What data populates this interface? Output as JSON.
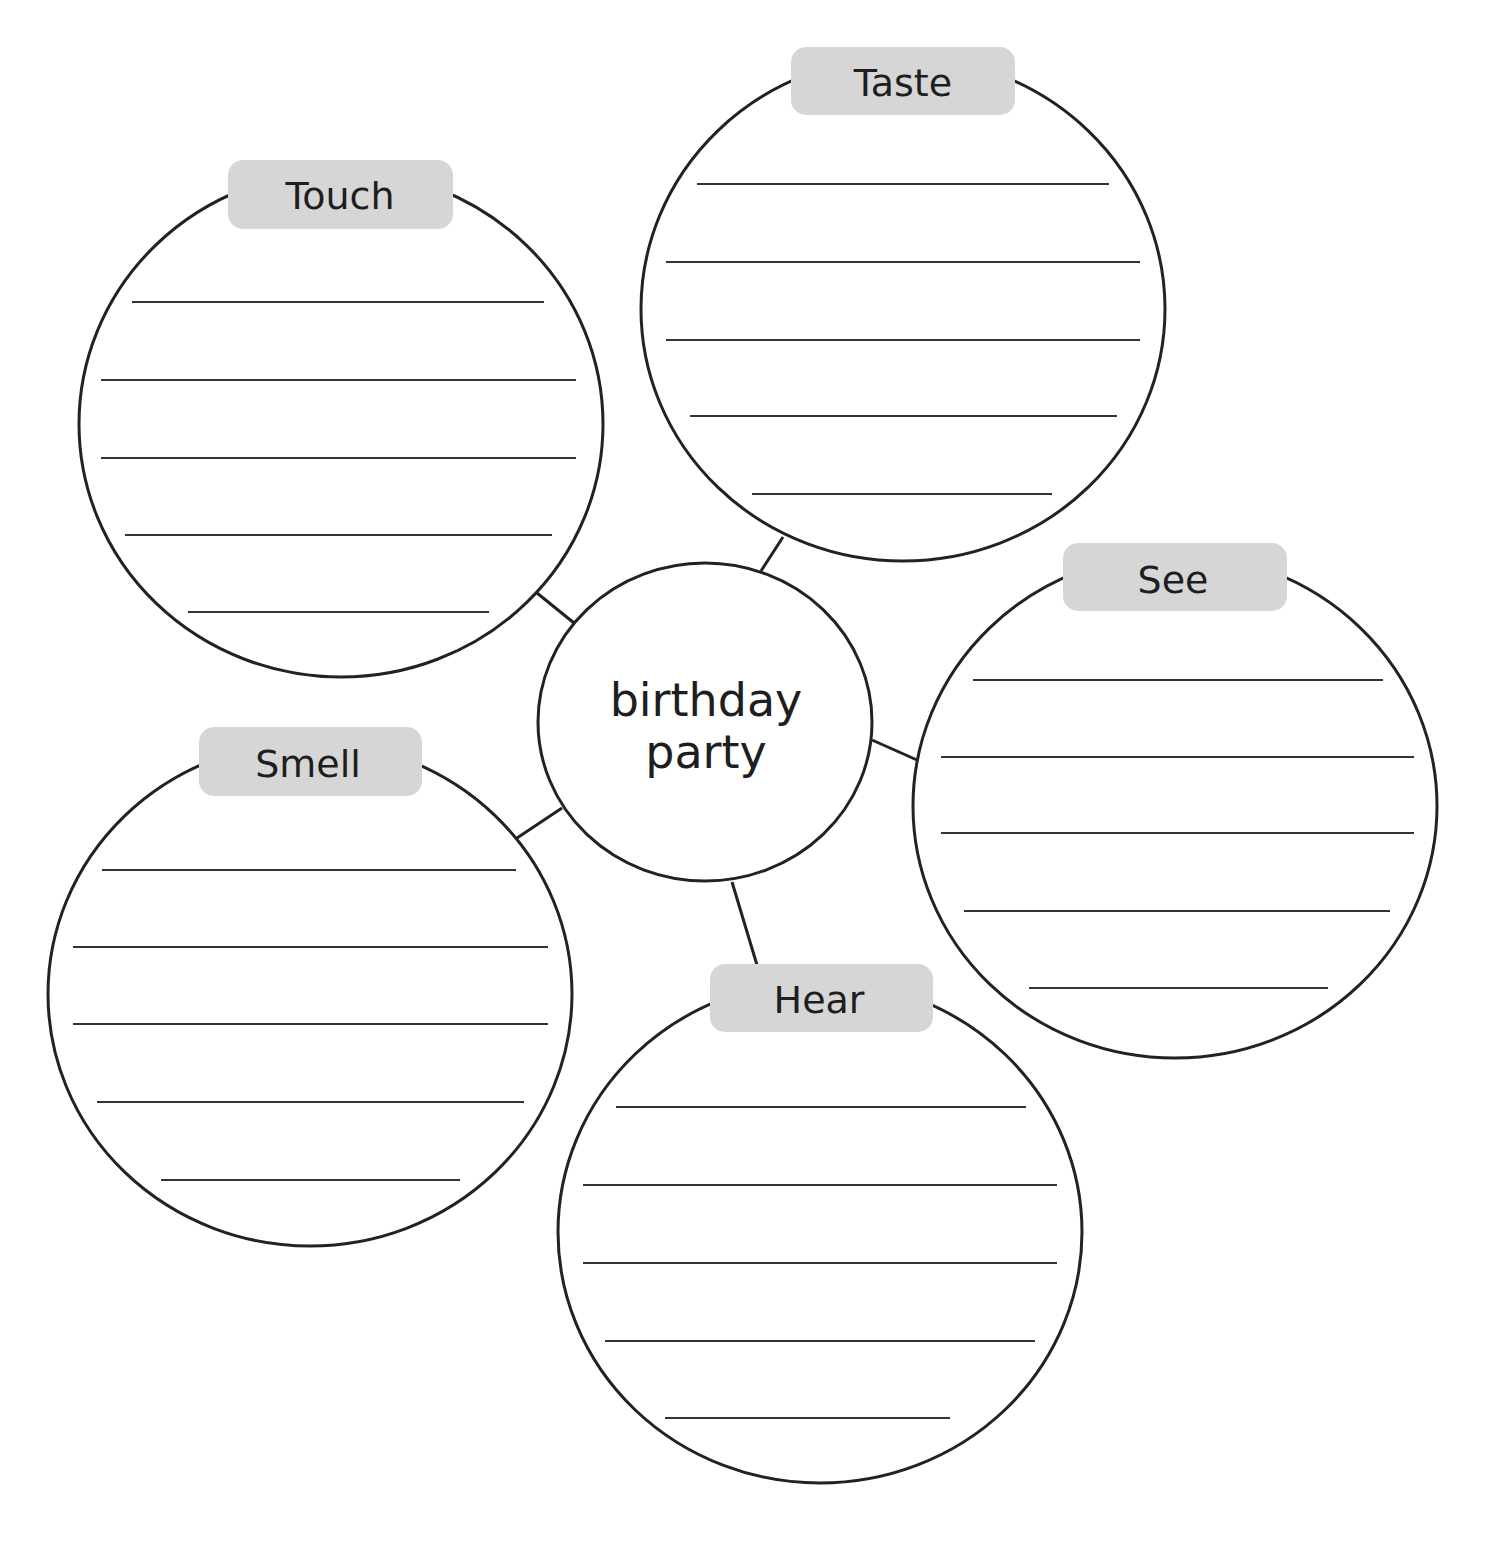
{
  "diagram": {
    "type": "sensory-word-web",
    "center": {
      "line1": "birthday",
      "line2": "party"
    },
    "colors": {
      "outline": "#222222",
      "writing_line": "#333333",
      "label_fill": "#d6d6d6",
      "label_text": "#1e1e1e",
      "background": "#ffffff"
    },
    "bubbles": [
      {
        "id": "touch",
        "label": "Touch",
        "writing_lines": 5
      },
      {
        "id": "taste",
        "label": "Taste",
        "writing_lines": 5
      },
      {
        "id": "see",
        "label": "See",
        "writing_lines": 5
      },
      {
        "id": "hear",
        "label": "Hear",
        "writing_lines": 5
      },
      {
        "id": "smell",
        "label": "Smell",
        "writing_lines": 5
      }
    ]
  }
}
